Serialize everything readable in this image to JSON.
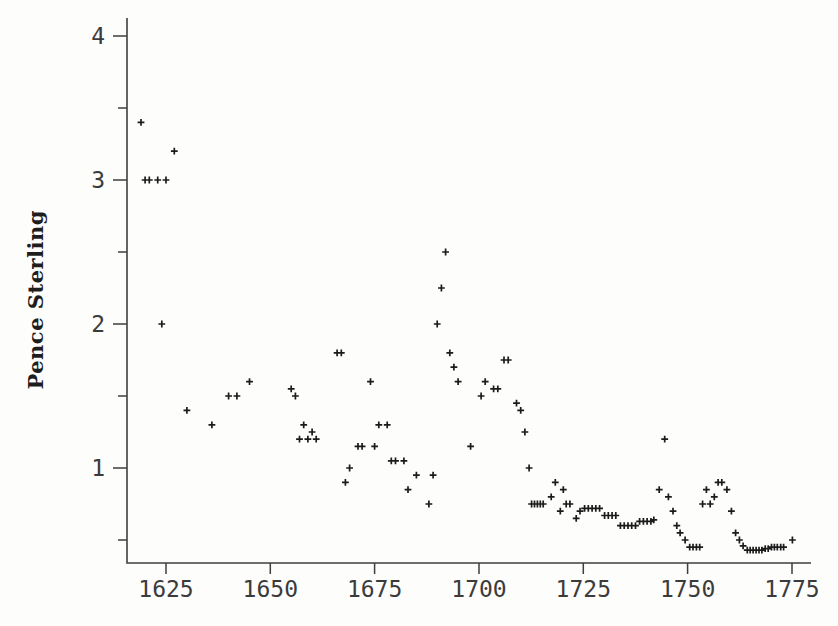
{
  "chart_data": {
    "type": "scatter",
    "title": "",
    "xlabel": "",
    "ylabel": "Pence Sterling",
    "marker": "+",
    "marker_color": "#1b1b1b",
    "axis_color": "#3f3f3f",
    "grid": false,
    "legend": null,
    "x_ticks": [
      1625,
      1650,
      1675,
      1700,
      1725,
      1750,
      1775
    ],
    "y_ticks_major": [
      1,
      2,
      3,
      4
    ],
    "y_ticks_minor": [
      0.5,
      1.5,
      2.5,
      3.5
    ],
    "xlim": [
      1615.6,
      1779.3
    ],
    "ylim": [
      0.34,
      4.11
    ],
    "points": [
      [
        1619,
        3.4
      ],
      [
        1620,
        3.0
      ],
      [
        1621,
        3.0
      ],
      [
        1623,
        3.0
      ],
      [
        1625,
        3.0
      ],
      [
        1624,
        2.0
      ],
      [
        1627,
        3.2
      ],
      [
        1630,
        1.4
      ],
      [
        1636,
        1.3
      ],
      [
        1640,
        1.5
      ],
      [
        1642,
        1.5
      ],
      [
        1645,
        1.6
      ],
      [
        1655,
        1.55
      ],
      [
        1656,
        1.5
      ],
      [
        1657,
        1.2
      ],
      [
        1658,
        1.3
      ],
      [
        1659,
        1.2
      ],
      [
        1660,
        1.25
      ],
      [
        1661,
        1.2
      ],
      [
        1666,
        1.8
      ],
      [
        1667,
        1.8
      ],
      [
        1668,
        0.9
      ],
      [
        1669,
        1.0
      ],
      [
        1671,
        1.15
      ],
      [
        1672,
        1.15
      ],
      [
        1674,
        1.6
      ],
      [
        1675,
        1.15
      ],
      [
        1676,
        1.3
      ],
      [
        1678,
        1.3
      ],
      [
        1679,
        1.05
      ],
      [
        1680,
        1.05
      ],
      [
        1682,
        1.05
      ],
      [
        1683,
        0.85
      ],
      [
        1685,
        0.95
      ],
      [
        1688,
        0.75
      ],
      [
        1689,
        0.95
      ],
      [
        1690,
        2.0
      ],
      [
        1691,
        2.25
      ],
      [
        1692,
        2.5
      ],
      [
        1693,
        1.8
      ],
      [
        1694,
        1.7
      ],
      [
        1695,
        1.6
      ],
      [
        1698,
        1.15
      ],
      [
        1700.5,
        1.5
      ],
      [
        1701.5,
        1.6
      ],
      [
        1703.5,
        1.55
      ],
      [
        1704.5,
        1.55
      ],
      [
        1706,
        1.75
      ],
      [
        1707,
        1.75
      ],
      [
        1709,
        1.45
      ],
      [
        1710,
        1.4
      ],
      [
        1711,
        1.25
      ],
      [
        1712,
        1.0
      ],
      [
        1712.6,
        0.75
      ],
      [
        1713.3,
        0.75
      ],
      [
        1714,
        0.75
      ],
      [
        1714.7,
        0.75
      ],
      [
        1715.4,
        0.75
      ],
      [
        1717.3,
        0.8
      ],
      [
        1718.3,
        0.9
      ],
      [
        1719.5,
        0.7
      ],
      [
        1720.2,
        0.85
      ],
      [
        1720.9,
        0.75
      ],
      [
        1721.8,
        0.75
      ],
      [
        1723.3,
        0.65
      ],
      [
        1724.2,
        0.7
      ],
      [
        1725.3,
        0.72
      ],
      [
        1726.2,
        0.72
      ],
      [
        1727.1,
        0.72
      ],
      [
        1728,
        0.72
      ],
      [
        1728.9,
        0.72
      ],
      [
        1730.1,
        0.67
      ],
      [
        1731,
        0.67
      ],
      [
        1731.9,
        0.67
      ],
      [
        1732.8,
        0.67
      ],
      [
        1733.9,
        0.6
      ],
      [
        1734.8,
        0.6
      ],
      [
        1735.7,
        0.6
      ],
      [
        1736.6,
        0.6
      ],
      [
        1737.5,
        0.6
      ],
      [
        1738.5,
        0.63
      ],
      [
        1739.4,
        0.63
      ],
      [
        1740.3,
        0.63
      ],
      [
        1741.2,
        0.63
      ],
      [
        1741.9,
        0.64
      ],
      [
        1743.2,
        0.85
      ],
      [
        1744.5,
        1.2
      ],
      [
        1745.4,
        0.8
      ],
      [
        1746.5,
        0.7
      ],
      [
        1747.4,
        0.6
      ],
      [
        1748.2,
        0.55
      ],
      [
        1749.4,
        0.5
      ],
      [
        1750.5,
        0.45
      ],
      [
        1751.3,
        0.45
      ],
      [
        1752.1,
        0.45
      ],
      [
        1752.9,
        0.45
      ],
      [
        1753.6,
        0.75
      ],
      [
        1754.5,
        0.85
      ],
      [
        1755.4,
        0.75
      ],
      [
        1756.4,
        0.8
      ],
      [
        1757.3,
        0.9
      ],
      [
        1758.2,
        0.9
      ],
      [
        1759.4,
        0.85
      ],
      [
        1760.5,
        0.7
      ],
      [
        1761.5,
        0.55
      ],
      [
        1762.4,
        0.5
      ],
      [
        1763.3,
        0.46
      ],
      [
        1764.3,
        0.43
      ],
      [
        1765,
        0.43
      ],
      [
        1765.7,
        0.43
      ],
      [
        1766.4,
        0.43
      ],
      [
        1767.1,
        0.43
      ],
      [
        1767.8,
        0.43
      ],
      [
        1768.6,
        0.44
      ],
      [
        1769.3,
        0.44
      ],
      [
        1770.1,
        0.45
      ],
      [
        1770.8,
        0.45
      ],
      [
        1771.5,
        0.45
      ],
      [
        1772.3,
        0.45
      ],
      [
        1773,
        0.45
      ],
      [
        1775.1,
        0.5
      ]
    ]
  }
}
